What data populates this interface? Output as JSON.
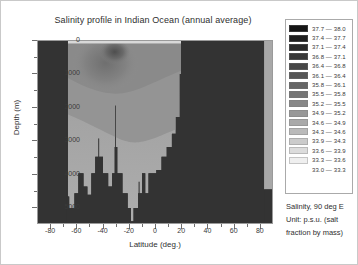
{
  "chart_data": {
    "type": "heatmap",
    "title": "Salinity profile in Indian Ocean (annual average)",
    "xlabel": "Latitude (deg.)",
    "ylabel": "Depth (m)",
    "xlim": [
      -90,
      90
    ],
    "ylim": [
      0,
      5500
    ],
    "xticks": [
      -80,
      -60,
      -40,
      -20,
      0,
      20,
      40,
      60,
      80
    ],
    "yticks": [
      0,
      1000,
      2000,
      3000,
      4000,
      5000
    ],
    "grid": false,
    "legend_position": "right",
    "colormap": "grayscale-reversed",
    "variable": "Salinity",
    "unit": "p.s.u.",
    "section": "90 deg E",
    "legend": [
      {
        "label": "37.7  —  38.0",
        "low": 37.7,
        "high": 38.0,
        "color": "#151515"
      },
      {
        "label": "37.4  —  37.7",
        "low": 37.4,
        "high": 37.7,
        "color": "#1f1f1f"
      },
      {
        "label": "37.1  —  37.4",
        "low": 37.1,
        "high": 37.4,
        "color": "#2a2a2a"
      },
      {
        "label": "36.8  —  37.1",
        "low": 36.8,
        "high": 37.1,
        "color": "#383838"
      },
      {
        "label": "36.4  —  36.8",
        "low": 36.4,
        "high": 36.8,
        "color": "#474747"
      },
      {
        "label": "36.1  —  36.4",
        "low": 36.1,
        "high": 36.4,
        "color": "#565656"
      },
      {
        "label": "35.8  —  36.1",
        "low": 35.8,
        "high": 36.1,
        "color": "#666666"
      },
      {
        "label": "35.5  —  35.8",
        "low": 35.5,
        "high": 35.8,
        "color": "#767676"
      },
      {
        "label": "35.2  —  35.5",
        "low": 35.2,
        "high": 35.5,
        "color": "#878787"
      },
      {
        "label": "34.9  —  35.2",
        "low": 34.9,
        "high": 35.2,
        "color": "#989898"
      },
      {
        "label": "34.6  —  34.9",
        "low": 34.6,
        "high": 34.9,
        "color": "#a9a9a9"
      },
      {
        "label": "34.3  —  34.6",
        "low": 34.3,
        "high": 34.6,
        "color": "#bababa"
      },
      {
        "label": "33.9  —  34.3",
        "low": 33.9,
        "high": 34.3,
        "color": "#cbcbcb"
      },
      {
        "label": "33.6  —  33.9",
        "low": 33.6,
        "high": 33.9,
        "color": "#dcdcdc"
      },
      {
        "label": "33.3  —  33.6",
        "low": 33.3,
        "high": 33.6,
        "color": "#efefef"
      },
      {
        "label": "33.0  —  33.3",
        "low": 33.0,
        "high": 33.3,
        "color": "#ffffff"
      }
    ],
    "caption_lines": [
      "Salinity, 90 deg E",
      "Unit: p.s.u. (salt",
      "fraction by mass)"
    ],
    "land_color": "#333333",
    "water_bands": [
      {
        "name": "surface-high-salinity-core",
        "color": "#5a5a5a"
      },
      {
        "name": "subtropical-subsurface-max",
        "color": "#7e7e7e"
      },
      {
        "name": "intermediate-water",
        "color": "#909090"
      },
      {
        "name": "deep-water",
        "color": "#a2a2a2"
      },
      {
        "name": "bottom-water",
        "color": "#ababab"
      }
    ],
    "ocean_left_edge_deg": -68,
    "ocean_right_edge_deg": 20,
    "bathymetry": [
      {
        "lat": -68,
        "depth": 0
      },
      {
        "lat": -67,
        "depth": 4700
      },
      {
        "lat": -66,
        "depth": 5050
      },
      {
        "lat": -63,
        "depth": 5050
      },
      {
        "lat": -62,
        "depth": 4600
      },
      {
        "lat": -60,
        "depth": 4600
      },
      {
        "lat": -59,
        "depth": 4000
      },
      {
        "lat": -56,
        "depth": 4000
      },
      {
        "lat": -55,
        "depth": 4400
      },
      {
        "lat": -53,
        "depth": 4400
      },
      {
        "lat": -52,
        "depth": 4650
      },
      {
        "lat": -50,
        "depth": 4650
      },
      {
        "lat": -49,
        "depth": 4000
      },
      {
        "lat": -47,
        "depth": 4000
      },
      {
        "lat": -46,
        "depth": 3500
      },
      {
        "lat": -44,
        "depth": 3500
      },
      {
        "lat": -43.5,
        "depth": 2950
      },
      {
        "lat": -43,
        "depth": 3500
      },
      {
        "lat": -41,
        "depth": 3500
      },
      {
        "lat": -40,
        "depth": 4000
      },
      {
        "lat": -37,
        "depth": 4000
      },
      {
        "lat": -36,
        "depth": 4400
      },
      {
        "lat": -34,
        "depth": 4400
      },
      {
        "lat": -33,
        "depth": 4000
      },
      {
        "lat": -32,
        "depth": 4000
      },
      {
        "lat": -31,
        "depth": 3200
      },
      {
        "lat": -30.5,
        "depth": 1950
      },
      {
        "lat": -30,
        "depth": 3200
      },
      {
        "lat": -29,
        "depth": 4000
      },
      {
        "lat": -26,
        "depth": 4000
      },
      {
        "lat": -25,
        "depth": 4600
      },
      {
        "lat": -22,
        "depth": 4600
      },
      {
        "lat": -21,
        "depth": 5050
      },
      {
        "lat": -19,
        "depth": 5050
      },
      {
        "lat": -18.5,
        "depth": 5450
      },
      {
        "lat": -17,
        "depth": 5450
      },
      {
        "lat": -16.5,
        "depth": 5050
      },
      {
        "lat": -14,
        "depth": 5050
      },
      {
        "lat": -13,
        "depth": 4600
      },
      {
        "lat": -12.5,
        "depth": 4250
      },
      {
        "lat": -12,
        "depth": 4600
      },
      {
        "lat": -11,
        "depth": 4600
      },
      {
        "lat": -10,
        "depth": 4000
      },
      {
        "lat": -8,
        "depth": 4000
      },
      {
        "lat": -7.5,
        "depth": 4600
      },
      {
        "lat": -6,
        "depth": 4600
      },
      {
        "lat": -5,
        "depth": 4000
      },
      {
        "lat": 0,
        "depth": 4000
      },
      {
        "lat": 1,
        "depth": 3900
      },
      {
        "lat": 4,
        "depth": 3900
      },
      {
        "lat": 5,
        "depth": 3500
      },
      {
        "lat": 8,
        "depth": 3500
      },
      {
        "lat": 9,
        "depth": 3200
      },
      {
        "lat": 12,
        "depth": 3200
      },
      {
        "lat": 13,
        "depth": 2800
      },
      {
        "lat": 15,
        "depth": 2800
      },
      {
        "lat": 16,
        "depth": 2300
      },
      {
        "lat": 18,
        "depth": 2300
      },
      {
        "lat": 19,
        "depth": 1000
      },
      {
        "lat": 20,
        "depth": 0
      }
    ]
  }
}
